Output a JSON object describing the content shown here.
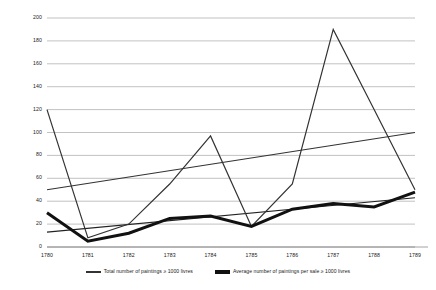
{
  "chart_data": {
    "type": "line",
    "title": "",
    "xlabel": "",
    "ylabel": "",
    "categories": [
      "1780",
      "1781",
      "1782",
      "1783",
      "1784",
      "1785",
      "1786",
      "1787",
      "1788",
      "1789"
    ],
    "ylim": [
      0,
      200
    ],
    "ytick_values": [
      0,
      20,
      40,
      60,
      80,
      100,
      120,
      140,
      160,
      180,
      200
    ],
    "ytick_labels": [
      "0",
      "20",
      "40",
      "60",
      "80",
      "100",
      "120",
      "140",
      "160",
      "180",
      "200"
    ],
    "grid": true,
    "legend_position": "bottom",
    "series": [
      {
        "name": "Total number of paintings ≥ 1000 livres",
        "style": "thin",
        "color": "#333333",
        "values": [
          120,
          8,
          20,
          55,
          97,
          18,
          55,
          190,
          120,
          50
        ]
      },
      {
        "name": "Average number of paintings per sale ≥ 1000 livres",
        "style": "thick",
        "color": "#111111",
        "values": [
          30,
          5,
          12,
          25,
          27,
          18,
          33,
          38,
          35,
          48
        ]
      }
    ],
    "trendlines": [
      {
        "name": "trendline-total",
        "style": "thin",
        "color": "#333333",
        "x0": "1780",
        "x1": "1789",
        "y0": 50,
        "y1": 100
      },
      {
        "name": "trendline-average",
        "style": "thin",
        "color": "#222222",
        "x0": "1780",
        "x1": "1789",
        "y0": 13,
        "y1": 43
      }
    ]
  },
  "legend": {
    "entries": [
      {
        "label": "Total number of paintings ≥ 1000 livres"
      },
      {
        "label": "Average number of paintings per sale ≥ 1000 livres"
      }
    ]
  }
}
